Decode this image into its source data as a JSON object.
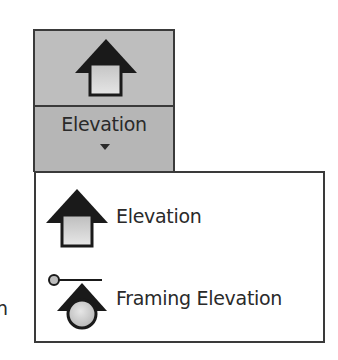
{
  "ribbon_button": {
    "label": "Elevation",
    "icon": "elevation-arrow-icon",
    "caret": "chevron-down-icon"
  },
  "dropdown": {
    "items": [
      {
        "label": "Elevation",
        "icon": "elevation-arrow-icon"
      },
      {
        "label": "Framing Elevation",
        "icon": "framing-elevation-icon"
      }
    ]
  },
  "background": {
    "partial_text": "n"
  },
  "colors": {
    "button_fill": "#bdbdbd",
    "border": "#3a3a3a",
    "icon_dark": "#1a1a1a",
    "icon_fill": "#d2d2d2",
    "menu_bg": "#ffffff"
  }
}
